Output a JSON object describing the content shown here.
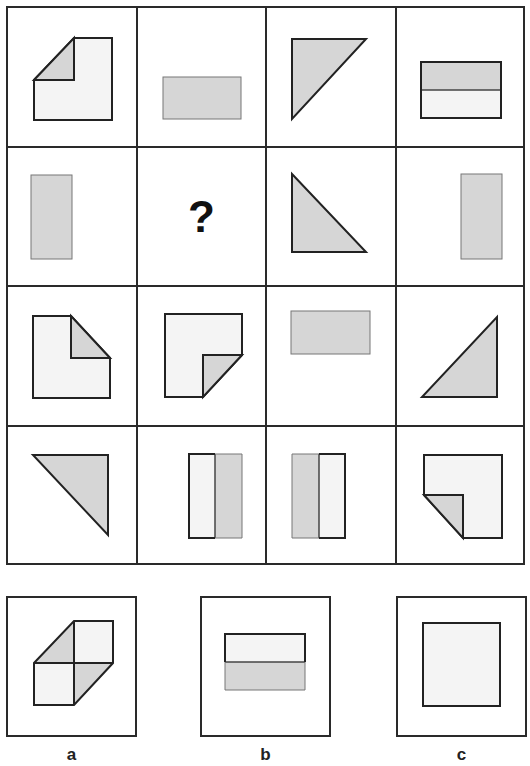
{
  "puzzle": {
    "question_mark": "?",
    "colors": {
      "light_fill": "#f4f4f4",
      "dark_fill": "#d6d6d6",
      "stroke": "#222222"
    },
    "grid": [
      [
        "square-folded-top-left-corner",
        "grey-horizontal-rectangle",
        "grey-triangle-top-left",
        "horizontal-rectangle-grey-top-light-bottom"
      ],
      [
        "grey-vertical-rectangle-left",
        "question-mark",
        "grey-triangle-bottom-left",
        "grey-vertical-rectangle-right"
      ],
      [
        "square-folded-top-right-corner",
        "square-folded-bottom-right-corner",
        "grey-horizontal-rectangle-top",
        "grey-triangle-bottom-right"
      ],
      [
        "grey-triangle-top-right",
        "vertical-rectangle-light-left-grey-right",
        "vertical-rectangle-grey-left-light-right",
        "square-folded-bottom-left-corner"
      ]
    ]
  },
  "options": [
    {
      "label": "a",
      "shape": "two-folded-squares-diagonal"
    },
    {
      "label": "b",
      "shape": "horizontal-rectangle-light-top-grey-bottom"
    },
    {
      "label": "c",
      "shape": "light-square"
    }
  ]
}
